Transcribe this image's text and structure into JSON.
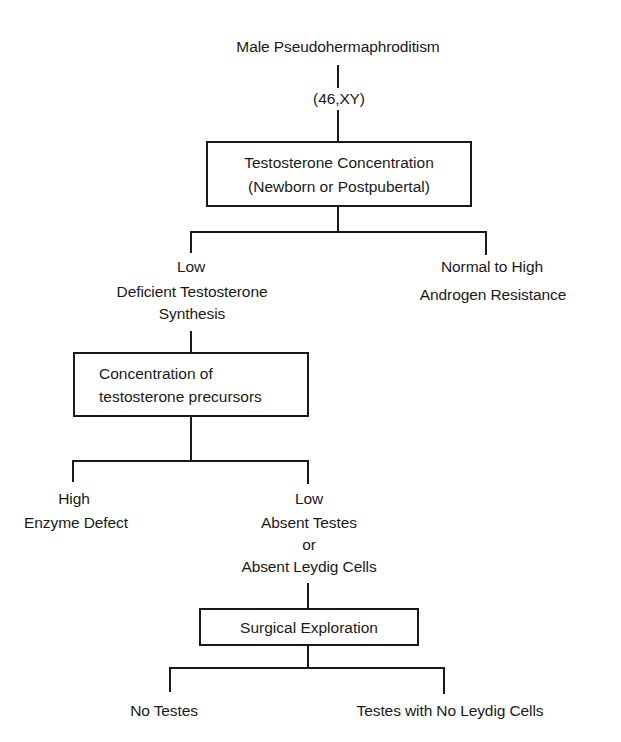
{
  "diagram": {
    "type": "flowchart",
    "root": {
      "title": "Male Pseudohermaphroditism",
      "karyotype": "(46,XY)"
    },
    "box_testosterone": {
      "line1": "Testosterone Concentration",
      "line2": "(Newborn or Postpubertal)"
    },
    "branch_low": {
      "level": "Low",
      "line1": "Deficient Testosterone",
      "line2": "Synthesis"
    },
    "branch_high": {
      "level": "Normal to High",
      "diagnosis": "Androgen Resistance"
    },
    "box_precursors": {
      "line1": "Concentration of",
      "line2": "testosterone precursors"
    },
    "precursor_high": {
      "level": "High",
      "diagnosis": "Enzyme Defect"
    },
    "precursor_low": {
      "level": "Low",
      "line1": "Absent Testes",
      "line2": "or",
      "line3": "Absent Leydig Cells"
    },
    "box_surgical": {
      "label": "Surgical Exploration"
    },
    "outcome_left": {
      "label": "No Testes"
    },
    "outcome_right": {
      "label": "Testes with No Leydig Cells"
    },
    "colors": {
      "ink": "#1a1a1a",
      "background": "#ffffff"
    }
  }
}
